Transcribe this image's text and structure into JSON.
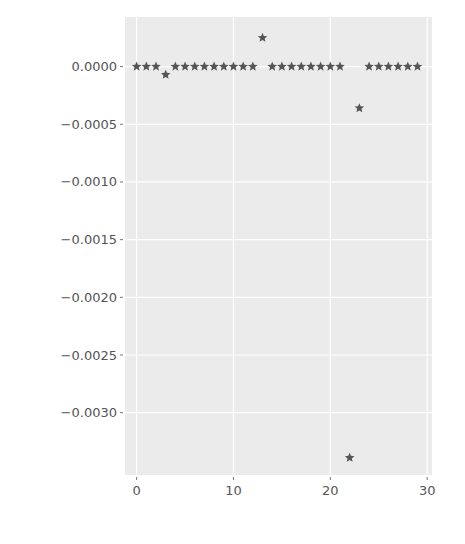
{
  "chart_data": {
    "type": "scatter",
    "title": "",
    "xlabel": "",
    "ylabel": "",
    "marker": "star",
    "marker_color": "#555555",
    "background_color": "#ebebeb",
    "grid": true,
    "grid_color": "#ffffff",
    "xlim": [
      -1.2,
      30.5
    ],
    "ylim": [
      -0.00354,
      0.00043
    ],
    "xticks": [
      0,
      10,
      20,
      30
    ],
    "xtick_labels": [
      "0",
      "10",
      "20",
      "30"
    ],
    "yticks": [
      0.0,
      -0.0005,
      -0.001,
      -0.0015,
      -0.002,
      -0.0025,
      -0.003
    ],
    "ytick_labels": [
      "0.0000",
      "−0.0005",
      "−0.0010",
      "−0.0015",
      "−0.0020",
      "−0.0025",
      "−0.0030"
    ],
    "x": [
      0,
      1,
      2,
      3,
      4,
      5,
      6,
      7,
      8,
      9,
      10,
      11,
      12,
      13,
      14,
      15,
      16,
      17,
      18,
      19,
      20,
      21,
      22,
      23,
      24,
      25,
      26,
      27,
      28,
      29
    ],
    "values": [
      0,
      0,
      0,
      -7e-05,
      0,
      0,
      0,
      0,
      0,
      0,
      0,
      0,
      0,
      0.00025,
      0,
      0,
      0,
      0,
      0,
      0,
      0,
      0,
      -0.00339,
      -0.00036,
      0,
      0,
      0,
      0,
      0,
      0
    ]
  }
}
